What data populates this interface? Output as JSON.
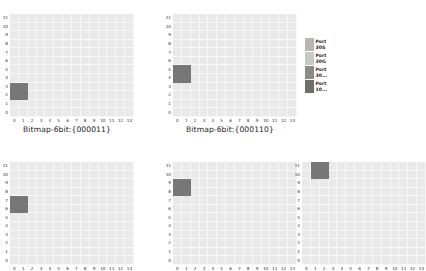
{
  "figure": {
    "background": "#ffffff",
    "grid_base_color": "#e9e9e9",
    "grid_line_color": "#f7f7f7",
    "highlight_color": "#7f7f7f",
    "tick_text_color": "#2b2b2b",
    "title_text_color": "#222222"
  },
  "legend": {
    "rows": [
      {
        "swatch": "#b5b5b5",
        "label": "Port\n30S"
      },
      {
        "swatch": "#c8c8c8",
        "label": "Port\n30G"
      },
      {
        "swatch": "#8a8a8a",
        "label": "Port\n30..."
      },
      {
        "swatch": "#6e6e6e",
        "label": "Port\n10..."
      }
    ]
  },
  "chart_data": [
    {
      "id": "chart-top-left",
      "type": "heatmap",
      "title": "Bitmap-6bit:{000011}",
      "xlabel": "",
      "ylabel": "",
      "xticks": [
        "0",
        "1",
        "2",
        "3",
        "4",
        "5",
        "6",
        "7",
        "8",
        "9",
        "10",
        "11",
        "12",
        "13"
      ],
      "yticks": [
        "11",
        "10",
        "9",
        "8",
        "7",
        "6",
        "5",
        "4",
        "3",
        "2",
        "1",
        "0"
      ],
      "xlim": [
        0,
        13
      ],
      "ylim": [
        0,
        11
      ],
      "grid": true,
      "base_value": "#e9e9e9",
      "highlights": [
        {
          "x0": 0,
          "x1": 1,
          "y0": 2,
          "y1": 3,
          "color": "#777777"
        }
      ]
    },
    {
      "id": "chart-top-right",
      "type": "heatmap",
      "title": "Bitmap-6bit:{000110}",
      "xlabel": "",
      "ylabel": "",
      "xticks": [
        "0",
        "1",
        "2",
        "3",
        "4",
        "5",
        "6",
        "7",
        "8",
        "9",
        "10",
        "11",
        "12",
        "13"
      ],
      "yticks": [
        "11",
        "10",
        "9",
        "8",
        "7",
        "6",
        "5",
        "4",
        "3",
        "2",
        "1",
        "0"
      ],
      "xlim": [
        0,
        13
      ],
      "ylim": [
        0,
        11
      ],
      "grid": true,
      "base_value": "#e9e9e9",
      "highlights": [
        {
          "x0": 0,
          "x1": 1,
          "y0": 4,
          "y1": 5,
          "color": "#777777"
        }
      ]
    },
    {
      "id": "chart-bottom-left",
      "type": "heatmap",
      "title": "",
      "xlabel": "",
      "ylabel": "",
      "xticks": [
        "0",
        "1",
        "2",
        "3",
        "4",
        "5",
        "6",
        "7",
        "8",
        "9",
        "10",
        "11",
        "12",
        "13"
      ],
      "yticks": [
        "11",
        "10",
        "9",
        "8",
        "7",
        "6",
        "5",
        "4",
        "3",
        "2",
        "1",
        "0"
      ],
      "xlim": [
        0,
        13
      ],
      "ylim": [
        0,
        11
      ],
      "grid": true,
      "base_value": "#e9e9e9",
      "highlights": [
        {
          "x0": 0,
          "x1": 1,
          "y0": 6,
          "y1": 7,
          "color": "#777777"
        }
      ]
    },
    {
      "id": "chart-bottom-middle",
      "type": "heatmap",
      "title": "",
      "xlabel": "",
      "ylabel": "",
      "xticks": [
        "0",
        "1",
        "2",
        "3",
        "4",
        "5",
        "6",
        "7",
        "8",
        "9",
        "10",
        "11",
        "12",
        "13"
      ],
      "yticks": [
        "11",
        "10",
        "9",
        "8",
        "7",
        "6",
        "5",
        "4",
        "3",
        "2",
        "1",
        "0"
      ],
      "xlim": [
        0,
        13
      ],
      "ylim": [
        0,
        11
      ],
      "grid": true,
      "base_value": "#e9e9e9",
      "highlights": [
        {
          "x0": 0,
          "x1": 1,
          "y0": 8,
          "y1": 9,
          "color": "#777777"
        }
      ]
    },
    {
      "id": "chart-bottom-right",
      "type": "heatmap",
      "title": "",
      "xlabel": "",
      "ylabel": "",
      "xticks": [
        "0",
        "1",
        "2",
        "3",
        "4",
        "5",
        "6",
        "7",
        "8",
        "9",
        "10",
        "11",
        "12",
        "13"
      ],
      "yticks": [
        "11",
        "10",
        "9",
        "8",
        "7",
        "6",
        "5",
        "4",
        "3",
        "2",
        "1",
        "0"
      ],
      "xlim": [
        0,
        13
      ],
      "ylim": [
        0,
        11
      ],
      "grid": true,
      "base_value": "#e9e9e9",
      "highlights": [
        {
          "x0": 1,
          "x1": 2,
          "y0": 10,
          "y1": 11,
          "color": "#777777"
        }
      ]
    }
  ]
}
